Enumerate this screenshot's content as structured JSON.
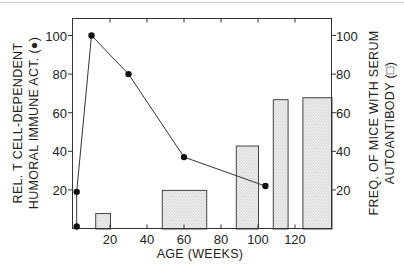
{
  "chart_data": {
    "type": "bar+line",
    "title": "",
    "xlabel": "AGE (WEEKS)",
    "ylabel_left": [
      "REL. T CELL-DEPENDENT",
      "HUMORAL IMMUNE ACT. (●)"
    ],
    "ylabel_right": [
      "FREQ. OF MICE WITH SERUM",
      "AUTOANTIBODY (□)"
    ],
    "xlim": [
      0,
      140
    ],
    "ylim_left": [
      0,
      110
    ],
    "ylim_right": [
      0,
      110
    ],
    "x_ticks": [
      20,
      40,
      60,
      80,
      100,
      120
    ],
    "y_ticks_left": [
      20,
      40,
      60,
      80,
      100
    ],
    "y_ticks_right": [
      20,
      40,
      60,
      80,
      100
    ],
    "grid": false,
    "series": [
      {
        "name": "Relative T cell-dependent humoral immune activity",
        "type": "line",
        "marker": "filled-circle",
        "axis": "left",
        "x": [
          2,
          2,
          10,
          30,
          60,
          104
        ],
        "y": [
          1,
          19,
          100,
          80,
          37,
          22
        ]
      },
      {
        "name": "Frequency of mice with serum autoantibody",
        "type": "bar",
        "fill": "stippled-gray",
        "axis": "right",
        "bars": [
          {
            "x_start": 12,
            "x_end": 20,
            "value": 8
          },
          {
            "x_start": 48,
            "x_end": 72,
            "value": 20
          },
          {
            "x_start": 88,
            "x_end": 100,
            "value": 43
          },
          {
            "x_start": 108,
            "x_end": 116,
            "value": 67
          },
          {
            "x_start": 124,
            "x_end": 140,
            "value": 68
          }
        ]
      }
    ]
  },
  "labels": {
    "x_axis": "AGE (WEEKS)",
    "left_line1": "REL. T CELL-DEPENDENT",
    "left_line2": "HUMORAL IMMUNE ACT. (●)",
    "right_line1": "FREQ. OF MICE WITH SERUM",
    "right_line2": "AUTOANTIBODY (□)",
    "x_ticks": [
      "20",
      "40",
      "60",
      "80",
      "100",
      "120"
    ],
    "y_ticks": [
      "20",
      "40",
      "60",
      "80",
      "100"
    ]
  }
}
